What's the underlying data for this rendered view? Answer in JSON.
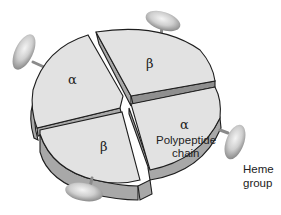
{
  "diagram": {
    "subunits": [
      {
        "id": "top-left",
        "label": "α"
      },
      {
        "id": "top-right",
        "label": "β"
      },
      {
        "id": "bottom-left",
        "label": "β"
      },
      {
        "id": "bottom-right",
        "label": "α",
        "caption_line1": "Polypeptide",
        "caption_line2": "chain"
      }
    ],
    "heme_label_line1": "Heme",
    "heme_label_line2": "group",
    "colors": {
      "face": "#e2e2e2",
      "side": "#a8a8a8",
      "outline": "#1e1e1e",
      "heme": "#c8c8c8"
    }
  }
}
